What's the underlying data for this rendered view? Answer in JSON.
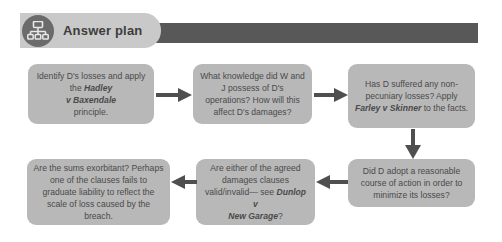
{
  "header": {
    "title": "Answer plan",
    "icon": "org-chart-icon",
    "pill_color": "#c9c9c9",
    "band_color": "#585858",
    "icon_circle_color": "#6b6b6b"
  },
  "theme": {
    "node_fill": "#b8b8b8",
    "node_text": "#4a4a4a",
    "arrow_color": "#4f4f4f",
    "page_background": "#ffffff"
  },
  "flowchart": {
    "type": "flowchart",
    "layout": "3-columns-by-2-rows-serpentine",
    "nodes": [
      {
        "id": "node-1",
        "order": 1,
        "name": "identify-losses-node",
        "text_html": "Identify D's losses and apply the <i>Hadley<br>v Baxendale</i><br>principle.",
        "text_plain": "Identify D's losses and apply the Hadley v Baxendale principle.",
        "italic_terms": [
          "Hadley v Baxendale"
        ]
      },
      {
        "id": "node-2",
        "order": 2,
        "name": "knowledge-of-operations-node",
        "text_html": "What knowledge did W and J possess of D's operations? How will this affect D's damages?",
        "text_plain": "What knowledge did W and J possess of D's operations? How will this affect D's damages?",
        "italic_terms": []
      },
      {
        "id": "node-3",
        "order": 3,
        "name": "non-pecuniary-losses-node",
        "text_html": "Has D suffered any non-pecuniary losses? Apply <i>Farley v Skinner</i> to the facts.",
        "text_plain": "Has D suffered any non-pecuniary losses? Apply Farley v Skinner to the facts.",
        "italic_terms": [
          "Farley v Skinner"
        ]
      },
      {
        "id": "node-4",
        "order": 4,
        "name": "mitigation-node",
        "text_html": "Did D adopt a reasonable course of action in order to minimize its losses?",
        "text_plain": "Did D adopt a reasonable course of action in order to minimize its losses?",
        "italic_terms": []
      },
      {
        "id": "node-5",
        "order": 5,
        "name": "agreed-damages-clauses-node",
        "text_html": "Are either of the agreed damages clauses valid/invalid&mdash; see <i>Dunlop v<br>New Garage</i>?",
        "text_plain": "Are either of the agreed damages clauses valid/invalid— see Dunlop v New Garage?",
        "italic_terms": [
          "Dunlop v New Garage"
        ]
      },
      {
        "id": "node-6",
        "order": 6,
        "name": "exorbitant-sums-node",
        "text_html": "Are the sums exorbitant? Perhaps one of the clauses fails to graduate liability to reflect the scale of loss caused by the breach.",
        "text_plain": "Are the sums exorbitant? Perhaps one of the clauses fails to graduate liability to reflect the scale of loss caused by the breach.",
        "italic_terms": []
      }
    ],
    "edges": [
      {
        "id": "arrow-1",
        "name": "arrow-node1-to-node2",
        "from": "node-1",
        "to": "node-2",
        "direction": "right"
      },
      {
        "id": "arrow-2",
        "name": "arrow-node2-to-node3",
        "from": "node-2",
        "to": "node-3",
        "direction": "right"
      },
      {
        "id": "arrow-3",
        "name": "arrow-node3-to-node4",
        "from": "node-3",
        "to": "node-4",
        "direction": "down"
      },
      {
        "id": "arrow-4",
        "name": "arrow-node4-to-node5",
        "from": "node-4",
        "to": "node-5",
        "direction": "left"
      },
      {
        "id": "arrow-5",
        "name": "arrow-node5-to-node6",
        "from": "node-5",
        "to": "node-6",
        "direction": "left"
      }
    ]
  }
}
